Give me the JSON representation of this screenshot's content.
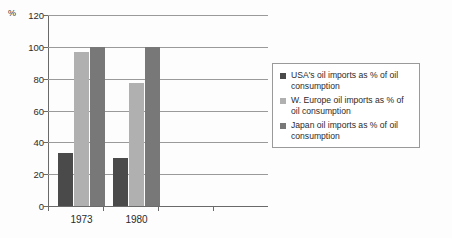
{
  "chart_data": {
    "type": "bar",
    "title": "",
    "subtitle": "",
    "xlabel": "",
    "ylabel": "%",
    "unit_label": "%",
    "categories": [
      "1973",
      "1980"
    ],
    "series": [
      {
        "name": "USA's oil imports as % of oil consumption",
        "color": "#4a4a4a",
        "values": [
          33,
          30
        ]
      },
      {
        "name": "W. Europe oil imports as % of oil consumption",
        "color": "#b0b0b0",
        "values": [
          97,
          77
        ]
      },
      {
        "name": "Japan oil imports as % of oil consumption",
        "color": "#787878",
        "values": [
          100,
          100
        ]
      }
    ],
    "ylim": [
      0,
      120
    ],
    "ytick_values": [
      0,
      20,
      40,
      60,
      80,
      100,
      120
    ],
    "ytick_labels": [
      "0",
      "20",
      "40",
      "60",
      "80",
      "100",
      "120"
    ],
    "grid": true,
    "grid_axis": "y",
    "legend_position": "right"
  },
  "legend": {
    "entries": [
      {
        "label": "USA's oil imports as % of oil consumption",
        "color": "#4a4a4a"
      },
      {
        "label": "W. Europe oil imports as % of oil consumption",
        "color": "#b0b0b0"
      },
      {
        "label": "Japan oil imports as % of oil consumption",
        "color": "#787878"
      }
    ]
  }
}
